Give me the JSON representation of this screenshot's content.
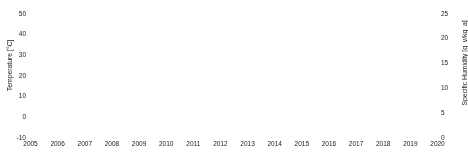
{
  "chart_data": {
    "type": "line",
    "title": "",
    "subtitle": "",
    "xlabel": "",
    "ylabel": "Temperature [°C]",
    "y2label": "Specific Humidity [g_v/kg_a]",
    "grid": false,
    "legend": "none",
    "xlim": [
      2005,
      2020
    ],
    "ylim": [
      -10,
      50
    ],
    "y2lim": [
      0,
      25
    ],
    "xticks": [
      2005,
      2006,
      2007,
      2008,
      2009,
      2010,
      2011,
      2012,
      2013,
      2014,
      2015,
      2016,
      2017,
      2018,
      2019,
      2020
    ],
    "xticklabels": [
      "2005",
      "2006",
      "2007",
      "2008",
      "2009",
      "2010",
      "2011",
      "2012",
      "2013",
      "2014",
      "2015",
      "2016",
      "2017",
      "2018",
      "2019",
      "2020"
    ],
    "yticks": [
      -10,
      0,
      10,
      20,
      30,
      40,
      50
    ],
    "yticklabels": [
      "-10",
      "0",
      "10",
      "20",
      "30",
      "40",
      "50"
    ],
    "y2ticks": [
      0,
      5,
      10,
      15,
      20,
      25
    ],
    "y2ticklabels": [
      "0",
      "5",
      "10",
      "15",
      "20",
      "25"
    ],
    "x_start": 2005.0,
    "x_end": 2019.58,
    "samples_per_year": 420,
    "series": [
      {
        "name": "Temperature",
        "axis": "left",
        "color": "#9a9a9a",
        "units": "°C",
        "annual_mean": 18.5,
        "annual_amplitude": 12.5,
        "summer_peak_typical": 41,
        "summer_peak_max": 46,
        "winter_min_typical": -2,
        "winter_min_max": -7,
        "diurnal_amplitude": 9.0,
        "noise_sd": 3.2,
        "phase_peak_month": 7.1
      },
      {
        "name": "Specific Humidity",
        "axis": "right",
        "color": "#2e2e2e",
        "units": "g_v/kg_a",
        "annual_mean": 8.2,
        "annual_amplitude": 4.6,
        "summer_peak_typical": 20.5,
        "summer_peak_max": 23.5,
        "winter_min_typical": 2.0,
        "winter_min_max": 0.6,
        "diurnal_amplitude": 2.2,
        "noise_sd": 2.1,
        "phase_peak_month": 7.6
      }
    ]
  },
  "axes": {
    "left_label": "Temperature [°C]",
    "right_label": "Specific Humidity [g_v/kg_a]"
  }
}
